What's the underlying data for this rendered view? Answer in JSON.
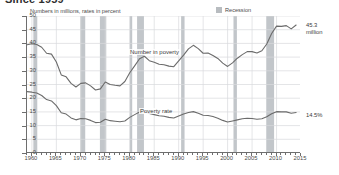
{
  "header": {
    "title": "Since 1959",
    "units_note": "Numbers in millions, rates in percent"
  },
  "legend": {
    "items": [
      {
        "label": "Recession",
        "color": "#b8bcc0"
      }
    ]
  },
  "callouts": {
    "number_in_poverty": {
      "value": "45.3",
      "unit": "million"
    },
    "poverty_rate": {
      "value": "14.5%"
    }
  },
  "colors": {
    "line": "#6b6b6b",
    "recession_band": "#c2c6ca",
    "grid": "#d8dadd",
    "axis": "#6e6e6e",
    "text": "#4a4a4a"
  },
  "chart_data": {
    "type": "line",
    "title": "Since 1959",
    "subtitle": "Numbers in millions, rates in percent",
    "xlabel": "",
    "ylabel": "",
    "xlim": [
      1959,
      2015
    ],
    "ylim": [
      0,
      50
    ],
    "yticks": [
      0,
      5,
      10,
      15,
      20,
      25,
      30,
      35,
      40,
      45,
      50
    ],
    "xticks": [
      1960,
      1965,
      1970,
      1975,
      1980,
      1985,
      1990,
      1995,
      2000,
      2005,
      2010,
      2015
    ],
    "grid": true,
    "legend_position": "top-right",
    "annotations": [
      {
        "text": "Number in poverty",
        "x": 1984,
        "y": 37.5
      },
      {
        "text": "Poverty rate",
        "x": 1986,
        "y": 15.5
      },
      {
        "text": "45.3 million",
        "x": 2015.5,
        "y": 45.3
      },
      {
        "text": "14.5%",
        "x": 2015.5,
        "y": 14.5
      }
    ],
    "x": [
      1959,
      1960,
      1961,
      1962,
      1963,
      1964,
      1965,
      1966,
      1967,
      1968,
      1969,
      1970,
      1971,
      1972,
      1973,
      1974,
      1975,
      1976,
      1977,
      1978,
      1979,
      1980,
      1981,
      1982,
      1983,
      1984,
      1985,
      1986,
      1987,
      1988,
      1989,
      1990,
      1991,
      1992,
      1993,
      1994,
      1995,
      1996,
      1997,
      1998,
      1999,
      2000,
      2001,
      2002,
      2003,
      2004,
      2005,
      2006,
      2007,
      2008,
      2009,
      2010,
      2011,
      2012,
      2013,
      2014
    ],
    "series": [
      {
        "name": "Number in poverty",
        "unit": "millions",
        "values": [
          39.5,
          39.9,
          39.6,
          38.6,
          36.4,
          36.1,
          33.2,
          28.5,
          27.8,
          25.4,
          24.1,
          25.4,
          25.6,
          24.5,
          23.0,
          23.4,
          25.9,
          25.0,
          24.7,
          24.5,
          26.1,
          29.3,
          31.8,
          34.4,
          35.3,
          33.7,
          33.1,
          32.4,
          32.2,
          31.7,
          31.5,
          33.6,
          35.7,
          38.0,
          39.3,
          38.1,
          36.4,
          36.5,
          35.6,
          34.5,
          32.8,
          31.6,
          32.9,
          34.6,
          35.9,
          37.0,
          37.0,
          36.5,
          37.3,
          39.8,
          43.6,
          46.3,
          46.2,
          46.5,
          45.3,
          46.7
        ]
      },
      {
        "name": "Poverty rate",
        "unit": "percent",
        "values": [
          22.4,
          22.2,
          21.9,
          21.0,
          19.5,
          19.0,
          17.3,
          14.7,
          14.2,
          12.8,
          12.1,
          12.6,
          12.5,
          11.9,
          11.1,
          11.2,
          12.3,
          11.8,
          11.6,
          11.4,
          11.7,
          13.0,
          14.0,
          15.0,
          15.2,
          14.4,
          14.0,
          13.6,
          13.4,
          13.0,
          12.8,
          13.5,
          14.2,
          14.8,
          15.1,
          14.5,
          13.8,
          13.7,
          13.3,
          12.7,
          11.9,
          11.3,
          11.7,
          12.1,
          12.5,
          12.7,
          12.6,
          12.3,
          12.5,
          13.2,
          14.3,
          15.1,
          15.0,
          15.0,
          14.5,
          14.8
        ]
      }
    ],
    "recessions": [
      {
        "start": 1960.3,
        "end": 1961.1
      },
      {
        "start": 1969.9,
        "end": 1970.9
      },
      {
        "start": 1973.9,
        "end": 1975.2
      },
      {
        "start": 1980.0,
        "end": 1980.5
      },
      {
        "start": 1981.5,
        "end": 1982.9
      },
      {
        "start": 1990.5,
        "end": 1991.2
      },
      {
        "start": 2001.2,
        "end": 2001.9
      },
      {
        "start": 2007.9,
        "end": 2009.5
      }
    ]
  }
}
